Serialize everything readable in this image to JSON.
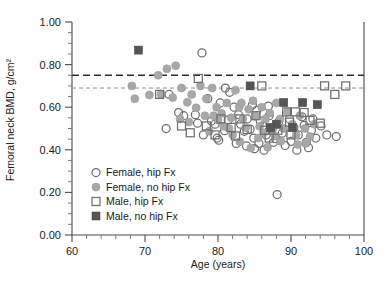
{
  "chart_data": {
    "type": "scatter",
    "title": "",
    "xlabel": "Age (years)",
    "ylabel": "Femoral neck BMD, g/cm²",
    "xlim": [
      60,
      100
    ],
    "ylim": [
      0.0,
      1.0
    ],
    "x_ticks": [
      60,
      70,
      80,
      90,
      100
    ],
    "x_tick_labels": [
      "60",
      "70",
      "80",
      "90",
      "100"
    ],
    "x_minor_step": 2,
    "y_ticks": [
      0.0,
      0.2,
      0.4,
      0.6,
      0.8,
      1.0
    ],
    "y_tick_labels": [
      "0.00",
      "0.20",
      "0.40",
      "0.60",
      "0.80",
      "1.00"
    ],
    "y_minor_step": 0.05,
    "grid": false,
    "legend_position": "lower-left-inside",
    "reference_lines": [
      {
        "name": "upper-threshold",
        "y": 0.75,
        "style": "dashed",
        "color": "#2e2e2e",
        "width": 1.6
      },
      {
        "name": "lower-threshold",
        "y": 0.69,
        "style": "dashed",
        "color": "#8e8e8e",
        "width": 1.0
      }
    ],
    "legend": [
      {
        "key": "female-hip-fx",
        "label": "Female, hip Fx",
        "marker": "open-circle",
        "color": "#6e6e6e"
      },
      {
        "key": "female-no-hip-fx",
        "label": "Female, no hip Fx",
        "marker": "filled-circle",
        "color": "#a8a8a8"
      },
      {
        "key": "male-hip-fx",
        "label": "Male, hip Fx",
        "marker": "open-square",
        "color": "#6e6e6e"
      },
      {
        "key": "male-no-hip-fx",
        "label": "Male, no hip Fx",
        "marker": "filled-square",
        "color": "#555555"
      }
    ],
    "series": [
      {
        "name": "Female, hip Fx",
        "key": "female-hip-fx",
        "marker": "open-circle",
        "points": [
          [
            77.8,
            0.855
          ],
          [
            73.3,
            0.66
          ],
          [
            74.6,
            0.575
          ],
          [
            75.3,
            0.56
          ],
          [
            72.9,
            0.5
          ],
          [
            76.9,
            0.565
          ],
          [
            78.0,
            0.47
          ],
          [
            79.1,
            0.535
          ],
          [
            79.6,
            0.52
          ],
          [
            80.1,
            0.445
          ],
          [
            81.0,
            0.69
          ],
          [
            81.6,
            0.67
          ],
          [
            80.3,
            0.62
          ],
          [
            82.2,
            0.6
          ],
          [
            82.8,
            0.565
          ],
          [
            83.1,
            0.52
          ],
          [
            83.6,
            0.487
          ],
          [
            84.0,
            0.545
          ],
          [
            84.4,
            0.497
          ],
          [
            84.9,
            0.455
          ],
          [
            85.3,
            0.585
          ],
          [
            85.8,
            0.535
          ],
          [
            86.1,
            0.512
          ],
          [
            86.6,
            0.47
          ],
          [
            87.0,
            0.56
          ],
          [
            87.4,
            0.498
          ],
          [
            87.9,
            0.452
          ],
          [
            88.3,
            0.53
          ],
          [
            88.8,
            0.478
          ],
          [
            89.2,
            0.42
          ],
          [
            85.0,
            0.405
          ],
          [
            86.3,
            0.398
          ],
          [
            82.5,
            0.43
          ],
          [
            83.9,
            0.418
          ],
          [
            89.8,
            0.545
          ],
          [
            90.4,
            0.505
          ],
          [
            91.0,
            0.47
          ],
          [
            91.5,
            0.555
          ],
          [
            92.1,
            0.435
          ],
          [
            92.8,
            0.492
          ],
          [
            93.4,
            0.455
          ],
          [
            94.1,
            0.512
          ],
          [
            94.9,
            0.47
          ],
          [
            96.2,
            0.462
          ],
          [
            90.8,
            0.398
          ],
          [
            92.4,
            0.41
          ],
          [
            88.1,
            0.19
          ],
          [
            78.6,
            0.64
          ],
          [
            77.2,
            0.525
          ],
          [
            80.9,
            0.49
          ],
          [
            84.7,
            0.61
          ],
          [
            86.9,
            0.605
          ],
          [
            81.4,
            0.54
          ],
          [
            79.9,
            0.455
          ],
          [
            93.0,
            0.545
          ],
          [
            90.0,
            0.44
          ],
          [
            87.6,
            0.435
          ],
          [
            85.6,
            0.43
          ],
          [
            91.8,
            0.515
          ]
        ]
      },
      {
        "name": "Female, no hip Fx",
        "key": "female-no-hip-fx",
        "marker": "filled-circle",
        "points": [
          [
            68.6,
            0.64
          ],
          [
            68.2,
            0.7
          ],
          [
            70.6,
            0.657
          ],
          [
            71.8,
            0.75
          ],
          [
            73.0,
            0.78
          ],
          [
            74.2,
            0.795
          ],
          [
            72.2,
            0.66
          ],
          [
            73.8,
            0.645
          ],
          [
            75.0,
            0.69
          ],
          [
            75.8,
            0.623
          ],
          [
            76.4,
            0.66
          ],
          [
            77.0,
            0.597
          ],
          [
            77.6,
            0.7
          ],
          [
            78.4,
            0.64
          ],
          [
            79.2,
            0.69
          ],
          [
            79.8,
            0.6
          ],
          [
            80.5,
            0.57
          ],
          [
            80.0,
            0.54
          ],
          [
            81.2,
            0.62
          ],
          [
            81.8,
            0.55
          ],
          [
            82.4,
            0.68
          ],
          [
            82.9,
            0.6
          ],
          [
            83.4,
            0.545
          ],
          [
            83.8,
            0.505
          ],
          [
            84.2,
            0.59
          ],
          [
            84.8,
            0.63
          ],
          [
            85.2,
            0.558
          ],
          [
            85.7,
            0.51
          ],
          [
            86.0,
            0.6
          ],
          [
            86.5,
            0.545
          ],
          [
            87.1,
            0.572
          ],
          [
            87.5,
            0.5
          ],
          [
            88.0,
            0.62
          ],
          [
            88.5,
            0.545
          ],
          [
            89.0,
            0.5
          ],
          [
            89.5,
            0.578
          ],
          [
            90.2,
            0.52
          ],
          [
            90.7,
            0.47
          ],
          [
            91.2,
            0.56
          ],
          [
            91.9,
            0.5
          ],
          [
            92.6,
            0.462
          ],
          [
            93.2,
            0.52
          ],
          [
            76.0,
            0.53
          ],
          [
            74.8,
            0.545
          ],
          [
            78.8,
            0.487
          ],
          [
            82.0,
            0.47
          ],
          [
            83.0,
            0.438
          ],
          [
            85.5,
            0.455
          ],
          [
            88.6,
            0.44
          ],
          [
            90.9,
            0.425
          ],
          [
            86.8,
            0.412
          ],
          [
            84.5,
            0.408
          ],
          [
            81.5,
            0.5
          ],
          [
            79.4,
            0.56
          ],
          [
            87.8,
            0.465
          ],
          [
            92.0,
            0.43
          ],
          [
            78.2,
            0.56
          ],
          [
            80.8,
            0.51
          ],
          [
            83.2,
            0.62
          ],
          [
            86.2,
            0.48
          ]
        ]
      },
      {
        "name": "Male, hip Fx",
        "key": "male-hip-fx",
        "marker": "open-square",
        "points": [
          [
            72.0,
            0.66
          ],
          [
            77.3,
            0.735
          ],
          [
            86.0,
            0.7
          ],
          [
            94.6,
            0.7
          ],
          [
            97.5,
            0.7
          ],
          [
            96.0,
            0.66
          ],
          [
            89.4,
            0.578
          ],
          [
            90.6,
            0.578
          ],
          [
            91.8,
            0.575
          ],
          [
            89.8,
            0.53
          ],
          [
            92.6,
            0.538
          ],
          [
            94.0,
            0.525
          ],
          [
            85.2,
            0.56
          ],
          [
            83.0,
            0.545
          ],
          [
            80.4,
            0.545
          ],
          [
            81.8,
            0.505
          ],
          [
            84.0,
            0.495
          ],
          [
            86.4,
            0.492
          ],
          [
            88.2,
            0.492
          ],
          [
            78.4,
            0.512
          ],
          [
            82.4,
            0.465
          ],
          [
            79.6,
            0.47
          ],
          [
            87.0,
            0.455
          ],
          [
            90.0,
            0.47
          ],
          [
            76.2,
            0.48
          ],
          [
            75.0,
            0.512
          ]
        ]
      },
      {
        "name": "Male, no hip Fx",
        "key": "male-no-hip-fx",
        "marker": "filled-square",
        "points": [
          [
            69.1,
            0.868
          ],
          [
            84.4,
            0.7
          ],
          [
            89.0,
            0.622
          ],
          [
            91.6,
            0.622
          ],
          [
            88.0,
            0.52
          ],
          [
            90.2,
            0.505
          ],
          [
            87.2,
            0.505
          ],
          [
            93.6,
            0.612
          ]
        ]
      }
    ]
  }
}
